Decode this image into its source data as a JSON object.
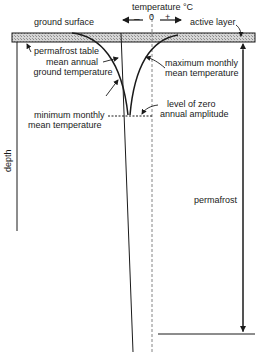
{
  "diagram": {
    "title_axis": "temperature °C",
    "minus_sign": "–",
    "zero_label": "0",
    "plus_sign": "+",
    "labels": {
      "ground_surface": "ground surface",
      "active_layer": "active layer",
      "permafrost_table": "permafrost table",
      "mean_annual_line1": "mean annual",
      "mean_annual_line2": "ground temperature",
      "max_monthly_line1": "maximum monthly",
      "max_monthly_line2": "mean temperature",
      "min_monthly_line1": "minimum monthly",
      "min_monthly_line2": "mean temperature",
      "zero_amp_line1": "level of zero",
      "zero_amp_line2": "annual amplitude",
      "depth": "depth",
      "permafrost": "permafrost"
    },
    "colors": {
      "ink": "#1a1a1a",
      "hatch_fill": "#c8c8c8",
      "background": "#ffffff"
    }
  }
}
